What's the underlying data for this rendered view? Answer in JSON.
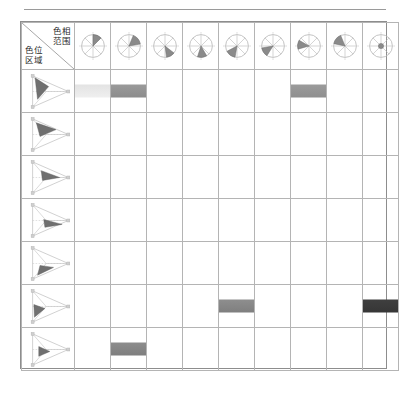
{
  "figure": {
    "name": "hue-range-vs-color-position-matrix",
    "corner_header": {
      "column_axis_label_line1": "色相",
      "column_axis_label_line2": "范围",
      "row_axis_label_line1": "色位",
      "row_axis_label_line2": "区域"
    },
    "colors": {
      "wedge_fill": "#8a8a8a",
      "wedge_stroke": "#6e6e6e",
      "wheel_stroke": "#b9b9b9",
      "triangle_stroke": "#c2c2c2",
      "triangle_fill": "#707070",
      "grid_line": "#b4b4b4",
      "frame": "#8d8d8d",
      "rule": "#9a9a9a"
    },
    "hue_columns": [
      {
        "id": "hue-col-1",
        "label": "1",
        "icon": "hue-wheel-icon",
        "wedge_start_deg": 45,
        "wedge_end_deg": 90,
        "center_dot": false
      },
      {
        "id": "hue-col-2",
        "label": "2",
        "icon": "hue-wheel-icon",
        "wedge_start_deg": 10,
        "wedge_end_deg": 68,
        "center_dot": false
      },
      {
        "id": "hue-col-3",
        "label": "3",
        "icon": "hue-wheel-icon",
        "wedge_start_deg": -82,
        "wedge_end_deg": -38,
        "center_dot": false
      },
      {
        "id": "hue-col-4",
        "label": "4",
        "icon": "hue-wheel-icon",
        "wedge_start_deg": -108,
        "wedge_end_deg": -60,
        "center_dot": false
      },
      {
        "id": "hue-col-5",
        "label": "5",
        "icon": "hue-wheel-icon",
        "wedge_start_deg": -152,
        "wedge_end_deg": -100,
        "center_dot": false
      },
      {
        "id": "hue-col-6",
        "label": "6",
        "icon": "hue-wheel-icon",
        "wedge_start_deg": -170,
        "wedge_end_deg": -122,
        "center_dot": false
      },
      {
        "id": "hue-col-7",
        "label": "7",
        "icon": "hue-wheel-icon",
        "wedge_start_deg": 150,
        "wedge_end_deg": 196,
        "center_dot": false
      },
      {
        "id": "hue-col-8",
        "label": "8",
        "icon": "hue-wheel-icon",
        "wedge_start_deg": 112,
        "wedge_end_deg": 168,
        "center_dot": false
      },
      {
        "id": "hue-col-9",
        "label": "9",
        "icon": "hue-wheel-icon",
        "wedge_start_deg": 0,
        "wedge_end_deg": 0,
        "center_dot": true
      }
    ],
    "position_rows": [
      {
        "id": "pos-row-1",
        "label": "1",
        "icon": "gamut-triangle-icon",
        "region": [
          [
            18,
            12
          ],
          [
            40,
            30
          ],
          [
            22,
            56
          ]
        ]
      },
      {
        "id": "pos-row-2",
        "label": "2",
        "icon": "gamut-triangle-icon",
        "region": [
          [
            20,
            16
          ],
          [
            52,
            30
          ],
          [
            26,
            44
          ]
        ]
      },
      {
        "id": "pos-row-3",
        "label": "3",
        "icon": "gamut-triangle-icon",
        "region": [
          [
            28,
            26
          ],
          [
            58,
            40
          ],
          [
            30,
            46
          ]
        ]
      },
      {
        "id": "pos-row-4",
        "label": "4",
        "icon": "gamut-triangle-icon",
        "region": [
          [
            32,
            38
          ],
          [
            62,
            48
          ],
          [
            34,
            54
          ]
        ]
      },
      {
        "id": "pos-row-5",
        "label": "5",
        "icon": "gamut-triangle-icon",
        "region": [
          [
            26,
            44
          ],
          [
            48,
            48
          ],
          [
            22,
            64
          ]
        ]
      },
      {
        "id": "pos-row-6",
        "label": "6",
        "icon": "gamut-triangle-icon",
        "region": [
          [
            16,
            36
          ],
          [
            34,
            44
          ],
          [
            17,
            62
          ]
        ]
      },
      {
        "id": "pos-row-7",
        "label": "7",
        "icon": "gamut-triangle-icon",
        "region": [
          [
            24,
            34
          ],
          [
            42,
            44
          ],
          [
            24,
            54
          ]
        ]
      }
    ],
    "cells": [
      {
        "row": 1,
        "col": 1,
        "bar": true,
        "fill": "#e3e3e3",
        "gradient_to": "#efefef"
      },
      {
        "row": 1,
        "col": 2,
        "bar": true,
        "fill": "#9a9a9a",
        "gradient_to": "#8c8c8c"
      },
      {
        "row": 1,
        "col": 3,
        "bar": false
      },
      {
        "row": 1,
        "col": 4,
        "bar": false
      },
      {
        "row": 1,
        "col": 5,
        "bar": false
      },
      {
        "row": 1,
        "col": 6,
        "bar": false
      },
      {
        "row": 1,
        "col": 7,
        "bar": true,
        "fill": "#9b9b9b",
        "gradient_to": "#8f8f8f"
      },
      {
        "row": 1,
        "col": 8,
        "bar": false
      },
      {
        "row": 1,
        "col": 9,
        "bar": false
      },
      {
        "row": 2,
        "col": 1,
        "bar": false
      },
      {
        "row": 2,
        "col": 2,
        "bar": false
      },
      {
        "row": 2,
        "col": 3,
        "bar": false
      },
      {
        "row": 2,
        "col": 4,
        "bar": false
      },
      {
        "row": 2,
        "col": 5,
        "bar": false
      },
      {
        "row": 2,
        "col": 6,
        "bar": false
      },
      {
        "row": 2,
        "col": 7,
        "bar": false
      },
      {
        "row": 2,
        "col": 8,
        "bar": false
      },
      {
        "row": 2,
        "col": 9,
        "bar": false
      },
      {
        "row": 3,
        "col": 1,
        "bar": false
      },
      {
        "row": 3,
        "col": 2,
        "bar": false
      },
      {
        "row": 3,
        "col": 3,
        "bar": false
      },
      {
        "row": 3,
        "col": 4,
        "bar": false
      },
      {
        "row": 3,
        "col": 5,
        "bar": false
      },
      {
        "row": 3,
        "col": 6,
        "bar": false
      },
      {
        "row": 3,
        "col": 7,
        "bar": false
      },
      {
        "row": 3,
        "col": 8,
        "bar": false
      },
      {
        "row": 3,
        "col": 9,
        "bar": false
      },
      {
        "row": 4,
        "col": 1,
        "bar": false
      },
      {
        "row": 4,
        "col": 2,
        "bar": false
      },
      {
        "row": 4,
        "col": 3,
        "bar": false
      },
      {
        "row": 4,
        "col": 4,
        "bar": false
      },
      {
        "row": 4,
        "col": 5,
        "bar": false
      },
      {
        "row": 4,
        "col": 6,
        "bar": false
      },
      {
        "row": 4,
        "col": 7,
        "bar": false
      },
      {
        "row": 4,
        "col": 8,
        "bar": false
      },
      {
        "row": 4,
        "col": 9,
        "bar": false
      },
      {
        "row": 5,
        "col": 1,
        "bar": false
      },
      {
        "row": 5,
        "col": 2,
        "bar": false
      },
      {
        "row": 5,
        "col": 3,
        "bar": false
      },
      {
        "row": 5,
        "col": 4,
        "bar": false
      },
      {
        "row": 5,
        "col": 5,
        "bar": false
      },
      {
        "row": 5,
        "col": 6,
        "bar": false
      },
      {
        "row": 5,
        "col": 7,
        "bar": false
      },
      {
        "row": 5,
        "col": 8,
        "bar": false
      },
      {
        "row": 5,
        "col": 9,
        "bar": false
      },
      {
        "row": 6,
        "col": 1,
        "bar": false
      },
      {
        "row": 6,
        "col": 2,
        "bar": false
      },
      {
        "row": 6,
        "col": 3,
        "bar": false
      },
      {
        "row": 6,
        "col": 4,
        "bar": false
      },
      {
        "row": 6,
        "col": 5,
        "bar": true,
        "fill": "#8e8e8e",
        "gradient_to": "#7f7f7f"
      },
      {
        "row": 6,
        "col": 6,
        "bar": false
      },
      {
        "row": 6,
        "col": 7,
        "bar": false
      },
      {
        "row": 6,
        "col": 8,
        "bar": false
      },
      {
        "row": 6,
        "col": 9,
        "bar": true,
        "fill": "#3f3f3f",
        "gradient_to": "#363636"
      },
      {
        "row": 7,
        "col": 1,
        "bar": false
      },
      {
        "row": 7,
        "col": 2,
        "bar": true,
        "fill": "#8d8d8d",
        "gradient_to": "#7e7e7e"
      },
      {
        "row": 7,
        "col": 3,
        "bar": false
      },
      {
        "row": 7,
        "col": 4,
        "bar": false
      },
      {
        "row": 7,
        "col": 5,
        "bar": false
      },
      {
        "row": 7,
        "col": 6,
        "bar": false
      },
      {
        "row": 7,
        "col": 7,
        "bar": false
      },
      {
        "row": 7,
        "col": 8,
        "bar": false
      },
      {
        "row": 7,
        "col": 9,
        "bar": false
      }
    ]
  }
}
